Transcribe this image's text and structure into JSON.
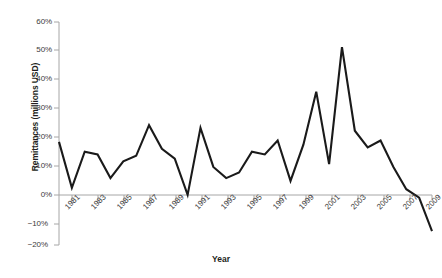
{
  "chart_data": {
    "type": "line",
    "title": "",
    "xlabel": "Year",
    "ylabel": "Remittances (millions USD)",
    "xlim": [
      1980,
      2009
    ],
    "ylim": [
      -20,
      60
    ],
    "grid": false,
    "legend": "none",
    "y_tick_labels": [
      "60%",
      "50%",
      "40%",
      "30%",
      "20%",
      "10%",
      "0%",
      "−10%",
      "−20%"
    ],
    "y_tick_values": [
      60,
      50,
      40,
      30,
      20,
      10,
      0,
      -10,
      -20
    ],
    "x_tick_labels": [
      "1981",
      "1983",
      "1985",
      "1987",
      "1989",
      "1991",
      "1993",
      "1995",
      "1997",
      "1999",
      "2001",
      "2003",
      "2005",
      "2007",
      "2009"
    ],
    "x_tick_values": [
      1981,
      1983,
      1985,
      1987,
      1989,
      1991,
      1993,
      1995,
      1997,
      1999,
      2001,
      2003,
      2005,
      2007,
      2009
    ],
    "series": [
      {
        "name": "Remittances growth",
        "color": "#1a1a1a",
        "x": [
          1980,
          1981,
          1982,
          1983,
          1984,
          1985,
          1986,
          1987,
          1988,
          1989,
          1990,
          1991,
          1992,
          1993,
          1994,
          1995,
          1996,
          1997,
          1998,
          1999,
          2000,
          2001,
          2002,
          2003,
          2004,
          2005,
          2006,
          2007,
          2008,
          2009
        ],
        "values": [
          17,
          0.5,
          13.5,
          12.5,
          4,
          10,
          12,
          23,
          14.5,
          11,
          -2,
          22,
          8,
          4,
          6,
          13.5,
          12.5,
          17.5,
          3,
          16,
          35,
          9,
          51,
          21,
          15,
          17.5,
          8,
          0,
          -3,
          -15
        ]
      }
    ]
  }
}
